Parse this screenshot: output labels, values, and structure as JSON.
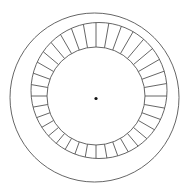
{
  "diagram": {
    "type": "segmented-ring",
    "background": "#ffffff",
    "stroke_color": "#555555",
    "stroke_width": 0.9,
    "outer_circle": {
      "cx": 94.5,
      "cy": 97.5,
      "r": 84.5
    },
    "ring_outer": {
      "cx": 99,
      "cy": 90.5,
      "r": 68
    },
    "ring_inner": {
      "cx": 96,
      "cy": 96,
      "r": 49
    },
    "segments": 36,
    "center_dot": {
      "cx": 96,
      "cy": 98.5,
      "r": 1.6,
      "color": "#111111"
    }
  }
}
